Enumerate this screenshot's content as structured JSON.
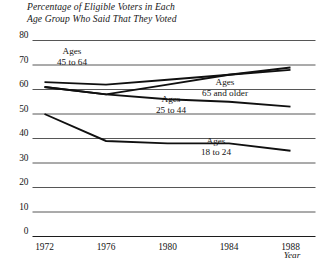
{
  "title": {
    "line1": "Percentage of Eligible Voters in Each",
    "line2": "Age Group Who Said That They Voted"
  },
  "chart_data": {
    "type": "line",
    "title": "Percentage of Eligible Voters in Each Age Group Who Said That They Voted",
    "xlabel": "Year",
    "ylabel": "",
    "categories": [
      "1972",
      "1976",
      "1980",
      "1984",
      "1988"
    ],
    "x": [
      1972,
      1976,
      1980,
      1984,
      1988
    ],
    "xlim": [
      1970.6,
      1989.4
    ],
    "ylim": [
      0,
      80
    ],
    "yticks": [
      0,
      10,
      20,
      30,
      40,
      50,
      60,
      70,
      80
    ],
    "ytick_labels": [
      "0",
      "10",
      "20",
      "30",
      "40",
      "50",
      "60",
      "70",
      "80"
    ],
    "grid": true,
    "legend": "inline-labels",
    "series": [
      {
        "name": "Ages 45 to 64",
        "label_line1": "Ages",
        "label_line2": "45 to 64",
        "values": [
          63,
          62,
          64,
          66,
          68
        ]
      },
      {
        "name": "Ages 65 and older",
        "label_line1": "Ages",
        "label_line2": "65 and older",
        "values": [
          61,
          58,
          62,
          66,
          69
        ]
      },
      {
        "name": "Ages 25 to 44",
        "label_line1": "Ages",
        "label_line2": "25 to 44",
        "values": [
          61,
          58,
          56,
          55,
          53
        ]
      },
      {
        "name": "Ages 18 to 24",
        "label_line1": "Ages",
        "label_line2": "18 to 24",
        "values": [
          50,
          39,
          38,
          38,
          35
        ]
      }
    ]
  },
  "colors": {
    "line": "#101010",
    "grid": "#2b2b2b",
    "background": "#ffffff"
  }
}
